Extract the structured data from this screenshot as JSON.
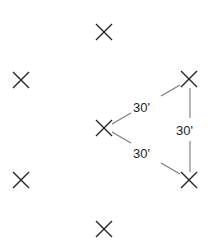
{
  "diagram": {
    "marks": [
      {
        "id": "top",
        "x": 104,
        "y": 32
      },
      {
        "id": "left-upper",
        "x": 21,
        "y": 80
      },
      {
        "id": "right-upper",
        "x": 189,
        "y": 79
      },
      {
        "id": "center",
        "x": 104,
        "y": 128
      },
      {
        "id": "left-lower",
        "x": 21,
        "y": 180
      },
      {
        "id": "right-lower",
        "x": 189,
        "y": 180
      },
      {
        "id": "bottom",
        "x": 104,
        "y": 229
      }
    ],
    "mark_half_size": 8,
    "edges": [
      {
        "from": "center",
        "to": "right-upper",
        "label": "30'"
      },
      {
        "from": "center",
        "to": "right-lower",
        "label": "30'"
      },
      {
        "from": "right-upper",
        "to": "right-lower",
        "label": "30'"
      }
    ],
    "labels": {
      "upper_edge": "30'",
      "lower_edge": "30'",
      "right_edge": "30'"
    },
    "colors": {
      "mark": "#2a2a2a",
      "edge": "#7a7a7a",
      "text": "#1e1e1e",
      "background": "#ffffff"
    }
  }
}
